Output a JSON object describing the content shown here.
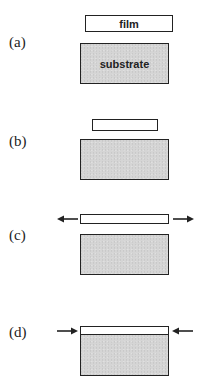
{
  "panels": [
    {
      "label": "(a)",
      "film_label": "film",
      "substrate_label": "substrate",
      "description": "separate film and substrate"
    },
    {
      "label": "(b)",
      "film_label": "",
      "substrate_label": "",
      "description": "film shorter than substrate"
    },
    {
      "label": "(c)",
      "film_label": "",
      "substrate_label": "",
      "description": "film stretched (tension arrows outward)"
    },
    {
      "label": "(d)",
      "film_label": "",
      "substrate_label": "",
      "description": "film bonded, compressed (arrows inward)"
    }
  ],
  "colors": {
    "substrate_fill": "#d5d5d5",
    "film_fill": "#ffffff",
    "stroke": "#222222"
  }
}
